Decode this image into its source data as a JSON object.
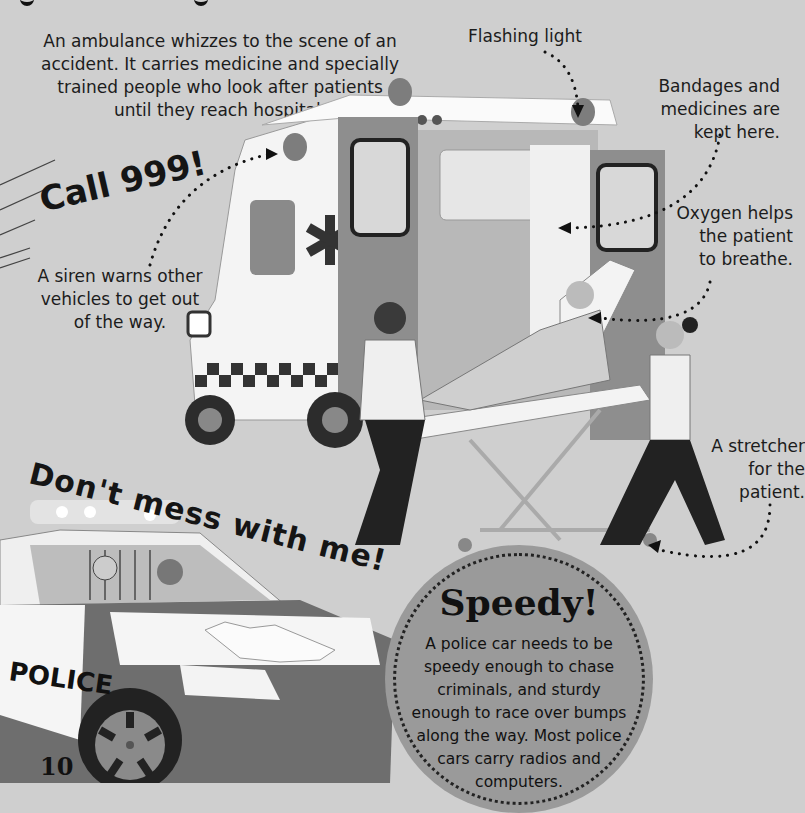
{
  "page": {
    "background_color": "#cfcfcf",
    "page_number": "10"
  },
  "intro": {
    "text_lines": [
      "An ambulance whizzes to the scene of an",
      "accident. It carries medicine and specially",
      "trained people who look after patients",
      "until they reach hospital."
    ]
  },
  "exclamations": {
    "call": "Call 999!",
    "dont_mess": "Don't mess with me!"
  },
  "labels": {
    "flashing_light": "Flashing light",
    "bandages": [
      "Bandages and",
      "medicines are",
      "kept here."
    ],
    "oxygen": [
      "Oxygen helps",
      "the patient",
      "to breathe."
    ],
    "siren": [
      "A siren warns other",
      "vehicles to get out",
      "of the way."
    ],
    "stretcher": [
      "A stretcher",
      "for the",
      "patient."
    ]
  },
  "badge": {
    "title": "Speedy!",
    "body_lines": [
      "A police car needs to be",
      "speedy enough to chase",
      "criminals, and sturdy",
      "enough to race over bumps",
      "along the way. Most police",
      "cars carry radios and",
      "computers."
    ],
    "color": "#9a9a9a"
  },
  "illustrations": {
    "ambulance": {
      "icon": "ambulance-icon",
      "emblem": "star-of-life-icon"
    },
    "police_car": {
      "icon": "police-car-icon",
      "door_text": "POLICE"
    }
  }
}
